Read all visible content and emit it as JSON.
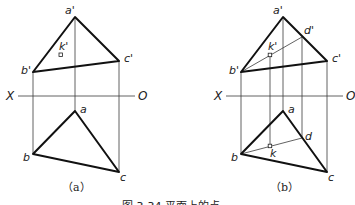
{
  "figure": {
    "caption": "图 3-34  平面上的点",
    "panels": [
      {
        "id": "a",
        "sublabel": "（a）",
        "axis": {
          "left": "X",
          "right": "O"
        },
        "front_view": {
          "a": "a'",
          "b": "b'",
          "c": "c'",
          "k": "k'"
        },
        "top_view": {
          "a": "a",
          "b": "b",
          "c": "c"
        }
      },
      {
        "id": "b",
        "sublabel": "（b）",
        "axis": {
          "left": "X",
          "right": "O"
        },
        "front_view": {
          "a": "a'",
          "b": "b'",
          "c": "c'",
          "d": "d'",
          "k": "k'"
        },
        "top_view": {
          "a": "a",
          "b": "b",
          "c": "c",
          "d": "d",
          "k": "k"
        }
      }
    ]
  }
}
